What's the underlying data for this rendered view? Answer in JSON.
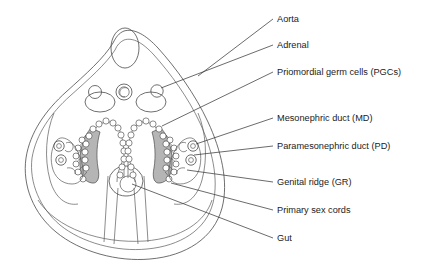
{
  "figure": {
    "background_color": "#ffffff",
    "line_color": "#4a4a4a",
    "text_color": "#1b1b1b",
    "shade_color": "#b5b5b5",
    "width": 436,
    "height": 268
  },
  "labels": [
    {
      "id": "aorta",
      "text": "Aorta",
      "text_x": 277,
      "text_y": 22,
      "leader": "M273,19 L198,76",
      "target": "dorsal aorta"
    },
    {
      "id": "adrenal",
      "text": "Adrenal",
      "text_x": 277,
      "text_y": 48,
      "leader": "M273,45 L161,88",
      "target": "adrenal gland primordium"
    },
    {
      "id": "pgcs",
      "text": "Priomordial germ cells (PGCs)",
      "text_x": 277,
      "text_y": 75,
      "leader": "M273,72 L162,126",
      "target": "primordial germ cells"
    },
    {
      "id": "md",
      "text": "Mesonephric duct (MD)",
      "text_x": 277,
      "text_y": 121,
      "leader": "M273,118 L196,144",
      "target": "mesonephric duct"
    },
    {
      "id": "pd",
      "text": "Paramesonephric duct (PD)",
      "text_x": 277,
      "text_y": 149,
      "leader": "M273,146 L194,155",
      "target": "paramesonephric duct"
    },
    {
      "id": "gr",
      "text": "Genital ridge (GR)",
      "text_x": 277,
      "text_y": 185,
      "leader": "M273,182 L187,170",
      "target": "genital ridge"
    },
    {
      "id": "psc",
      "text": "Primary sex cords",
      "text_x": 277,
      "text_y": 213,
      "leader": "M273,210 L171,183",
      "target": "primary sex cords"
    },
    {
      "id": "gut",
      "text": "Gut",
      "text_x": 277,
      "text_y": 241,
      "leader": "M273,238 L132,184",
      "target": "gut"
    }
  ],
  "structures": [
    {
      "id": "body-wall-outer",
      "name": "embryo body wall (outer)"
    },
    {
      "id": "body-wall-inner",
      "name": "embryo body wall (inner)"
    },
    {
      "id": "neural-tube",
      "name": "neural tube"
    },
    {
      "id": "aorta",
      "name": "dorsal aorta"
    },
    {
      "id": "adrenal-left",
      "name": "left adrenal primordium"
    },
    {
      "id": "adrenal-right",
      "name": "right adrenal primordium"
    },
    {
      "id": "genital-ridge-left",
      "name": "left genital ridge"
    },
    {
      "id": "genital-ridge-right",
      "name": "right genital ridge"
    },
    {
      "id": "mesonephros-left",
      "name": "left mesonephros"
    },
    {
      "id": "mesonephros-right",
      "name": "right mesonephros"
    },
    {
      "id": "gut",
      "name": "gut"
    },
    {
      "id": "coelomic-cavity",
      "name": "coelomic cavity"
    }
  ]
}
